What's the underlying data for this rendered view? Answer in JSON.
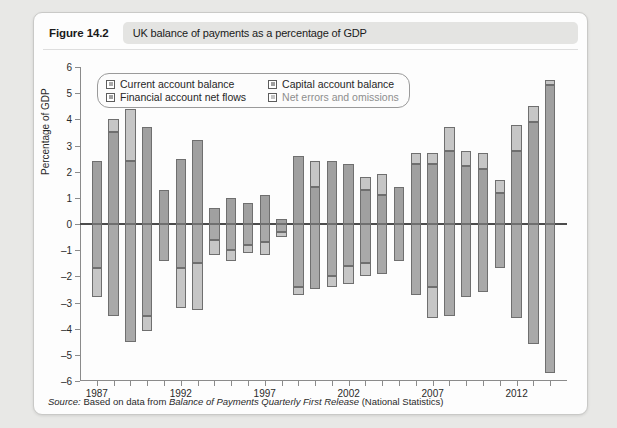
{
  "figure": {
    "label": "Figure 14.2",
    "title": "UK balance of payments as a percentage of GDP"
  },
  "source": {
    "prefix": "Source:",
    "text_before": " Based on data from ",
    "italic_title": "Balance of Payments Quarterly First Release",
    "text_after": " (National Statistics)"
  },
  "legend": {
    "items": [
      {
        "label": "Current account balance",
        "color": "#a9a9a9",
        "faded": false
      },
      {
        "label": "Capital account balance",
        "color": "#9e9e9e",
        "faded": false
      },
      {
        "label": "Financial account net flows",
        "color": "#a0a0a0",
        "faded": false
      },
      {
        "label": "Net errors and omissions",
        "color": "#c4c4c4",
        "faded": true
      }
    ]
  },
  "colors": {
    "current_account": "#a9a9a9",
    "capital_account": "#9e9e9e",
    "financial_account": "#a0a0a0",
    "net_errors": "#c6c6c6",
    "axis": "#8b8b8b",
    "zero_line": "#4c4c4c",
    "bar_outline": "#6f6f6f",
    "panel_bg": "#fdfdfd",
    "page_bg": "#e8e8e6"
  },
  "chart_data": {
    "type": "bar",
    "subtype": "stacked-diverging",
    "title": "UK balance of payments as a percentage of GDP",
    "xlabel": "",
    "ylabel": "Percentage of GDP",
    "ylim": [
      -6,
      6
    ],
    "yticks": [
      6,
      5,
      4,
      3,
      2,
      1,
      0,
      -1,
      -2,
      -3,
      -4,
      -5,
      -6
    ],
    "ytick_labels": [
      "6",
      "5",
      "4",
      "3",
      "2",
      "1",
      "0",
      "–1",
      "–2",
      "–3",
      "–4",
      "–5",
      "–6"
    ],
    "grid": false,
    "legend_position": "top-left-inside",
    "x": [
      1987,
      1988,
      1989,
      1990,
      1991,
      1992,
      1993,
      1994,
      1995,
      1996,
      1997,
      1998,
      1999,
      2000,
      2001,
      2002,
      2003,
      2004,
      2005,
      2006,
      2007,
      2008,
      2009,
      2010,
      2011,
      2012,
      2013,
      2014
    ],
    "xtick_labels_shown": [
      "1987",
      "1992",
      "1997",
      "2002",
      "2007",
      "2012"
    ],
    "series": [
      {
        "name": "Current account balance",
        "values": [
          -1.7,
          -3.5,
          -4.5,
          -3.5,
          -1.4,
          -1.7,
          -1.5,
          -0.6,
          -1.0,
          -0.8,
          -0.1,
          -0.3,
          -2.4,
          -2.5,
          -2.0,
          -1.6,
          -1.5,
          -1.9,
          -1.4,
          -2.7,
          -2.4,
          -3.5,
          -2.8,
          -2.6,
          -1.7,
          -3.6,
          -4.6,
          -5.7
        ]
      },
      {
        "name": "Capital account balance",
        "values": [
          0.0,
          0.0,
          0.0,
          0.0,
          0.0,
          0.0,
          0.0,
          0.0,
          0.0,
          0.0,
          0.0,
          0.0,
          0.0,
          0.0,
          0.0,
          0.0,
          0.0,
          0.0,
          0.0,
          0.0,
          0.0,
          0.0,
          0.0,
          0.0,
          0.0,
          0.0,
          0.0,
          0.0
        ]
      },
      {
        "name": "Financial account net flows",
        "values": [
          2.4,
          3.5,
          2.4,
          3.7,
          1.3,
          2.5,
          3.2,
          0.6,
          1.0,
          0.8,
          0.2,
          1.5,
          2.3,
          1.9,
          2.4,
          1.3,
          1.7,
          1.5,
          1.3,
          2.3,
          2.8,
          2.3,
          2.4,
          1.9,
          1.7,
          3.5,
          3.9,
          5.3
        ]
      },
      {
        "name": "Net errors and omissions",
        "values": [
          -1.1,
          0.5,
          0.0,
          0.0,
          0.0,
          0.0,
          -0.5,
          -0.3,
          -0.4,
          -0.4,
          -0.1,
          1.1,
          0.1,
          0.3,
          0.0,
          0.9,
          0.4,
          0.2,
          0.1,
          0.4,
          0.9,
          0.4,
          0.2,
          0.1,
          0.0,
          0.3,
          0.6,
          0.2
        ]
      }
    ],
    "bars": [
      {
        "year": 1987,
        "pos": [
          {
            "v": 2.4,
            "series": "financial"
          }
        ],
        "neg": [
          {
            "v": -1.7,
            "series": "current"
          },
          {
            "v": -1.1,
            "series": "errors"
          }
        ]
      },
      {
        "year": 1988,
        "pos": [
          {
            "v": 3.5,
            "series": "financial"
          },
          {
            "v": 0.5,
            "series": "errors"
          }
        ],
        "neg": [
          {
            "v": -3.5,
            "series": "current"
          }
        ]
      },
      {
        "year": 1989,
        "pos": [
          {
            "v": 2.4,
            "series": "financial"
          },
          {
            "v": 2.0,
            "series": "errors"
          }
        ],
        "neg": [
          {
            "v": -4.5,
            "series": "current"
          }
        ]
      },
      {
        "year": 1990,
        "pos": [
          {
            "v": 3.7,
            "series": "financial"
          }
        ],
        "neg": [
          {
            "v": -3.5,
            "series": "current"
          },
          {
            "v": -0.6,
            "series": "errors"
          }
        ]
      },
      {
        "year": 1991,
        "pos": [
          {
            "v": 1.3,
            "series": "financial"
          }
        ],
        "neg": [
          {
            "v": -1.4,
            "series": "current"
          }
        ]
      },
      {
        "year": 1992,
        "pos": [
          {
            "v": 2.5,
            "series": "financial"
          }
        ],
        "neg": [
          {
            "v": -1.7,
            "series": "current"
          },
          {
            "v": -1.5,
            "series": "errors"
          }
        ]
      },
      {
        "year": 1993,
        "pos": [
          {
            "v": 3.2,
            "series": "financial"
          }
        ],
        "neg": [
          {
            "v": -1.5,
            "series": "current"
          },
          {
            "v": -1.8,
            "series": "errors"
          }
        ]
      },
      {
        "year": 1994,
        "pos": [
          {
            "v": 0.6,
            "series": "financial"
          }
        ],
        "neg": [
          {
            "v": -0.6,
            "series": "current"
          },
          {
            "v": -0.6,
            "series": "errors"
          }
        ]
      },
      {
        "year": 1995,
        "pos": [
          {
            "v": 1.0,
            "series": "financial"
          }
        ],
        "neg": [
          {
            "v": -1.0,
            "series": "current"
          },
          {
            "v": -0.4,
            "series": "errors"
          }
        ]
      },
      {
        "year": 1996,
        "pos": [
          {
            "v": 0.8,
            "series": "financial"
          }
        ],
        "neg": [
          {
            "v": -0.8,
            "series": "current"
          },
          {
            "v": -0.3,
            "series": "errors"
          }
        ]
      },
      {
        "year": 1997,
        "pos": [
          {
            "v": 1.1,
            "series": "financial"
          }
        ],
        "neg": [
          {
            "v": -0.7,
            "series": "current"
          },
          {
            "v": -0.5,
            "series": "errors"
          }
        ]
      },
      {
        "year": 1998,
        "pos": [
          {
            "v": 0.2,
            "series": "financial"
          }
        ],
        "neg": [
          {
            "v": -0.3,
            "series": "current"
          },
          {
            "v": -0.2,
            "series": "errors"
          }
        ]
      },
      {
        "year": 1999,
        "pos": [
          {
            "v": 2.6,
            "series": "financial"
          }
        ],
        "neg": [
          {
            "v": -2.4,
            "series": "current"
          },
          {
            "v": -0.3,
            "series": "errors"
          }
        ]
      },
      {
        "year": 2000,
        "pos": [
          {
            "v": 1.4,
            "series": "financial"
          },
          {
            "v": 1.0,
            "series": "errors"
          }
        ],
        "neg": [
          {
            "v": -2.5,
            "series": "current"
          }
        ]
      },
      {
        "year": 2001,
        "pos": [
          {
            "v": 2.4,
            "series": "financial"
          }
        ],
        "neg": [
          {
            "v": -2.0,
            "series": "current"
          },
          {
            "v": -0.4,
            "series": "errors"
          }
        ]
      },
      {
        "year": 2002,
        "pos": [
          {
            "v": 2.3,
            "series": "financial"
          }
        ],
        "neg": [
          {
            "v": -1.6,
            "series": "current"
          },
          {
            "v": -0.7,
            "series": "errors"
          }
        ]
      },
      {
        "year": 2003,
        "pos": [
          {
            "v": 1.3,
            "series": "financial"
          },
          {
            "v": 0.5,
            "series": "errors"
          }
        ],
        "neg": [
          {
            "v": -1.5,
            "series": "current"
          },
          {
            "v": -0.5,
            "series": "errors"
          }
        ]
      },
      {
        "year": 2004,
        "pos": [
          {
            "v": 1.1,
            "series": "financial"
          },
          {
            "v": 0.8,
            "series": "errors"
          }
        ],
        "neg": [
          {
            "v": -1.9,
            "series": "current"
          }
        ]
      },
      {
        "year": 2005,
        "pos": [
          {
            "v": 1.4,
            "series": "financial"
          }
        ],
        "neg": [
          {
            "v": -1.4,
            "series": "current"
          }
        ]
      },
      {
        "year": 2006,
        "pos": [
          {
            "v": 2.3,
            "series": "financial"
          },
          {
            "v": 0.4,
            "series": "errors"
          }
        ],
        "neg": [
          {
            "v": -2.7,
            "series": "current"
          }
        ]
      },
      {
        "year": 2007,
        "pos": [
          {
            "v": 2.3,
            "series": "financial"
          },
          {
            "v": 0.4,
            "series": "errors"
          }
        ],
        "neg": [
          {
            "v": -2.4,
            "series": "current"
          },
          {
            "v": -1.2,
            "series": "errors"
          }
        ]
      },
      {
        "year": 2008,
        "pos": [
          {
            "v": 2.8,
            "series": "financial"
          },
          {
            "v": 0.9,
            "series": "errors"
          }
        ],
        "neg": [
          {
            "v": -3.5,
            "series": "current"
          }
        ]
      },
      {
        "year": 2009,
        "pos": [
          {
            "v": 2.2,
            "series": "financial"
          },
          {
            "v": 0.6,
            "series": "errors"
          }
        ],
        "neg": [
          {
            "v": -2.8,
            "series": "current"
          }
        ]
      },
      {
        "year": 2010,
        "pos": [
          {
            "v": 2.1,
            "series": "financial"
          },
          {
            "v": 0.6,
            "series": "errors"
          }
        ],
        "neg": [
          {
            "v": -2.6,
            "series": "current"
          }
        ]
      },
      {
        "year": 2011,
        "pos": [
          {
            "v": 1.2,
            "series": "financial"
          },
          {
            "v": 0.5,
            "series": "errors"
          }
        ],
        "neg": [
          {
            "v": -1.7,
            "series": "current"
          }
        ]
      },
      {
        "year": 2012,
        "pos": [
          {
            "v": 2.8,
            "series": "financial"
          },
          {
            "v": 1.0,
            "series": "errors"
          }
        ],
        "neg": [
          {
            "v": -3.6,
            "series": "current"
          }
        ]
      },
      {
        "year": 2013,
        "pos": [
          {
            "v": 3.9,
            "series": "financial"
          },
          {
            "v": 0.6,
            "series": "errors"
          }
        ],
        "neg": [
          {
            "v": -4.6,
            "series": "current"
          }
        ]
      },
      {
        "year": 2014,
        "pos": [
          {
            "v": 5.3,
            "series": "financial"
          },
          {
            "v": 0.2,
            "series": "errors"
          }
        ],
        "neg": [
          {
            "v": -5.7,
            "series": "current"
          }
        ]
      }
    ]
  }
}
